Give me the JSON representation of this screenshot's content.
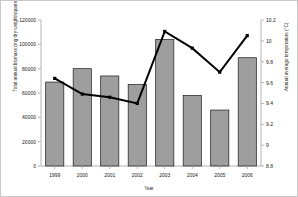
{
  "chart_data": {
    "type": "bar",
    "title": "",
    "xlabel": "Year",
    "ylabel": "Total annual biomass (mg dry weight/square meter)",
    "y2label": "Annual average temperature (°C)",
    "categories": [
      "1999",
      "2000",
      "2001",
      "2002",
      "2003",
      "2004",
      "2005",
      "2006"
    ],
    "ylim": [
      0,
      120000
    ],
    "y2lim": [
      8.8,
      10.2
    ],
    "yticks": [
      "0",
      "20000",
      "40000",
      "60000",
      "80000",
      "100000",
      "120000"
    ],
    "ytick_values": [
      0,
      20000,
      40000,
      60000,
      80000,
      100000,
      120000
    ],
    "y2ticks": [
      "8.8",
      "9",
      "9.2",
      "9.4",
      "9.6",
      "9.8",
      "10",
      "10.2"
    ],
    "y2tick_values": [
      8.8,
      9.0,
      9.2,
      9.4,
      9.6,
      9.8,
      10.0,
      10.2
    ],
    "grid": false,
    "legend": "none",
    "series": [
      {
        "name": "Total annual biomass (mg dry weight/square meter)",
        "type": "bar",
        "axis": "left",
        "color": "#9e9e9e",
        "edge_color": "#1a1a1a",
        "values": [
          69000,
          80000,
          74000,
          67000,
          104000,
          58000,
          46000,
          89000
        ]
      },
      {
        "name": "Annual average temperature (°C)",
        "type": "line",
        "axis": "right",
        "color": "#000000",
        "values": [
          9.64,
          9.49,
          9.46,
          9.4,
          10.09,
          9.93,
          9.7,
          10.05
        ]
      }
    ]
  },
  "colors": {
    "bar_fill": "#9e9e9e",
    "bar_edge": "#1a1a1a",
    "line": "#000000",
    "axis": "#b4b4b4",
    "text": "#1a1a1a",
    "background": "#ffffff",
    "frame": "#c9c9c9"
  }
}
